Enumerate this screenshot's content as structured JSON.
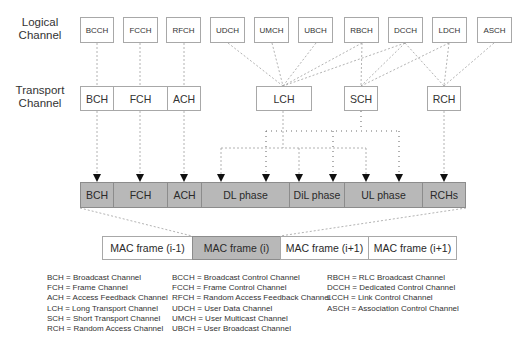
{
  "rows": {
    "logical_label": "Logical\nChannel",
    "logical_label_line1": "Logical",
    "logical_label_line2": "Channel",
    "transport_label_line1": "Transport",
    "transport_label_line2": "Channel"
  },
  "logical_channels": [
    {
      "label": "BCCH"
    },
    {
      "label": "FCCH"
    },
    {
      "label": "RFCH"
    },
    {
      "label": "UDCH"
    },
    {
      "label": "UMCH"
    },
    {
      "label": "UBCH"
    },
    {
      "label": "RBCH"
    },
    {
      "label": "DCCH"
    },
    {
      "label": "LDCH"
    },
    {
      "label": "ASCH"
    }
  ],
  "transport_channels": [
    {
      "label": "BCH"
    },
    {
      "label": "FCH"
    },
    {
      "label": "ACH"
    },
    {
      "label": "LCH"
    },
    {
      "label": "SCH"
    },
    {
      "label": "RCH"
    }
  ],
  "frame_structure": [
    {
      "label": "BCH"
    },
    {
      "label": "FCH"
    },
    {
      "label": "ACH"
    },
    {
      "label": "DL phase"
    },
    {
      "label": "DiL phase"
    },
    {
      "label": "UL phase"
    },
    {
      "label": "RCHs"
    }
  ],
  "mac_frames": [
    {
      "label": "MAC frame (i-1)",
      "active": false
    },
    {
      "label": "MAC frame (i)",
      "active": true
    },
    {
      "label": "MAC frame (i+1)",
      "active": false
    },
    {
      "label": "MAC frame (i+1)",
      "active": false
    }
  ],
  "legend": {
    "col1": [
      "BCH = Broadcast Channel",
      "FCH = Frame Channel",
      "ACH = Access Feedback Channel",
      "LCH = Long Transport Channel",
      "SCH = Short Transport Channel",
      "RCH = Random Access Channel"
    ],
    "col2": [
      "BCCH = Broadcast Control Channel",
      "FCCH = Frame Control Channel",
      "RFCH = Random Access Feedback Channel",
      "UDCH = User Data Channel",
      "UMCH = User Multicast Channel",
      "UBCH = User Broadcast Channel"
    ],
    "col3": [
      "RBCH = RLC Broadcast Channel",
      "DCCH = Dedicated Control Channel",
      "LCCH = Link Control Channel",
      "ASCH = Association Control Channel"
    ]
  },
  "colors": {
    "frame_fill": "#b8b8b8",
    "box_border": "#a8a8a8",
    "line": "#9a9a9a"
  }
}
